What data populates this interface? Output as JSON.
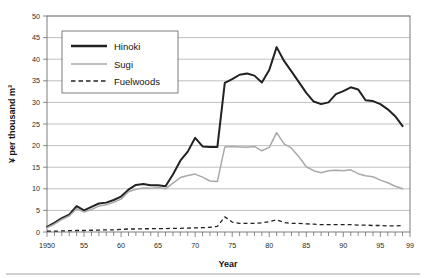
{
  "chart_data": {
    "type": "line",
    "title": "",
    "xlabel": "Year",
    "ylabel": "¥ per thousand m³",
    "xlim": [
      1950,
      1999
    ],
    "ylim": [
      0,
      50
    ],
    "grid": true,
    "legend_position": "top-left-inside",
    "x_tick_labels": [
      "1950",
      "55",
      "60",
      "65",
      "70",
      "75",
      "80",
      "85",
      "90",
      "95",
      "99"
    ],
    "x_tick_values": [
      1950,
      1955,
      1960,
      1965,
      1970,
      1975,
      1980,
      1985,
      1990,
      1995,
      1999
    ],
    "y_tick_labels": [
      "0",
      "5",
      "10",
      "15",
      "20",
      "25",
      "30",
      "35",
      "40",
      "45",
      "50"
    ],
    "y_tick_values": [
      0,
      5,
      10,
      15,
      20,
      25,
      30,
      35,
      40,
      45,
      50
    ],
    "x": [
      1950,
      1951,
      1952,
      1953,
      1954,
      1955,
      1956,
      1957,
      1958,
      1959,
      1960,
      1961,
      1962,
      1963,
      1964,
      1965,
      1966,
      1967,
      1968,
      1969,
      1970,
      1971,
      1972,
      1973,
      1974,
      1975,
      1976,
      1977,
      1978,
      1979,
      1980,
      1981,
      1982,
      1983,
      1984,
      1985,
      1986,
      1987,
      1988,
      1989,
      1990,
      1991,
      1992,
      1993,
      1994,
      1995,
      1996,
      1997,
      1998
    ],
    "series": [
      {
        "name": "Hinoki",
        "color": "#222222",
        "style": "solid",
        "width": "thick",
        "values": [
          1.2,
          2.1,
          3.2,
          4.0,
          6.0,
          5.0,
          5.8,
          6.6,
          6.8,
          7.4,
          8.2,
          9.8,
          10.9,
          11.1,
          10.8,
          10.8,
          10.6,
          13.3,
          16.5,
          18.6,
          21.8,
          19.8,
          19.7,
          19.7,
          34.5,
          35.4,
          36.4,
          36.7,
          36.2,
          34.6,
          37.5,
          42.8,
          39.6,
          37.2,
          34.7,
          32.2,
          30.2,
          29.6,
          30.0,
          31.9,
          32.6,
          33.5,
          33.0,
          30.5,
          30.3,
          29.6,
          28.4,
          26.8,
          24.5
        ]
      },
      {
        "name": "Sugi",
        "color": "#a9a9a9",
        "style": "solid",
        "width": "thin",
        "values": [
          1.0,
          1.8,
          2.9,
          3.7,
          5.4,
          4.6,
          5.2,
          6.0,
          6.3,
          6.9,
          7.6,
          9.3,
          9.9,
          10.2,
          10.1,
          10.3,
          10.0,
          11.3,
          12.6,
          13.1,
          13.4,
          12.7,
          11.8,
          11.7,
          19.7,
          19.8,
          19.7,
          19.6,
          19.8,
          18.8,
          19.6,
          23.0,
          20.4,
          19.4,
          17.4,
          15.1,
          14.2,
          13.7,
          14.2,
          14.3,
          14.2,
          14.4,
          13.5,
          13.0,
          12.8,
          12.0,
          11.4,
          10.6,
          10.0
        ]
      },
      {
        "name": "Fuelwoods",
        "color": "#222222",
        "style": "dashed",
        "width": "thin",
        "values": [
          0.2,
          0.2,
          0.25,
          0.3,
          0.35,
          0.35,
          0.4,
          0.45,
          0.5,
          0.5,
          0.6,
          0.7,
          0.7,
          0.75,
          0.75,
          0.8,
          0.8,
          0.85,
          0.85,
          0.9,
          0.95,
          1.0,
          1.1,
          1.3,
          3.5,
          2.3,
          2.0,
          2.0,
          2.0,
          2.1,
          2.4,
          2.8,
          2.2,
          2.0,
          2.0,
          1.9,
          1.8,
          1.7,
          1.7,
          1.7,
          1.7,
          1.7,
          1.6,
          1.6,
          1.5,
          1.5,
          1.4,
          1.4,
          1.5
        ]
      }
    ]
  },
  "legend": {
    "entries": [
      {
        "label": "Hinoki"
      },
      {
        "label": "Sugi"
      },
      {
        "label": "Fuelwoods"
      }
    ]
  }
}
